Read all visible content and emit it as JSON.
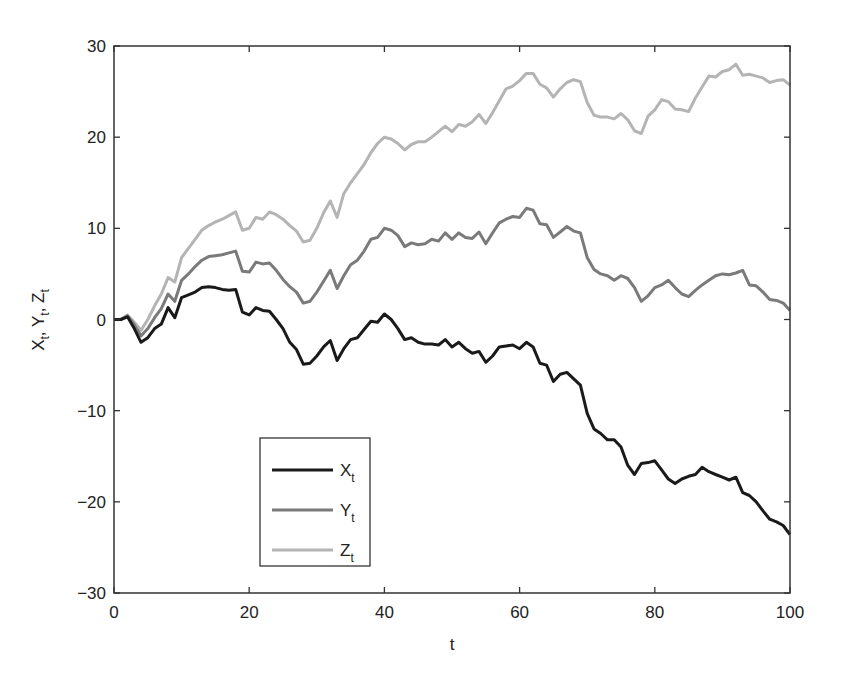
{
  "chart_data": {
    "type": "line",
    "title": "",
    "xlabel": "t",
    "ylabel": "X_t, Y_t, Z_t",
    "xlim": [
      0,
      100
    ],
    "ylim": [
      -30,
      30
    ],
    "xticks": [
      0,
      20,
      40,
      60,
      80,
      100
    ],
    "yticks": [
      -30,
      -20,
      -10,
      0,
      10,
      20,
      30
    ],
    "xtick_labels": [
      "0",
      "20",
      "40",
      "60",
      "80",
      "100"
    ],
    "ytick_labels": [
      "−30",
      "−20",
      "−10",
      "0",
      "10",
      "20",
      "30"
    ],
    "grid": false,
    "legend_position": "lower left (inside)",
    "x": [
      0,
      1,
      2,
      3,
      4,
      5,
      6,
      7,
      8,
      9,
      10,
      11,
      12,
      13,
      14,
      15,
      16,
      17,
      18,
      19,
      20,
      21,
      22,
      23,
      24,
      25,
      26,
      27,
      28,
      29,
      30,
      31,
      32,
      33,
      34,
      35,
      36,
      37,
      38,
      39,
      40,
      41,
      42,
      43,
      44,
      45,
      46,
      47,
      48,
      49,
      50,
      51,
      52,
      53,
      54,
      55,
      56,
      57,
      58,
      59,
      60,
      61,
      62,
      63,
      64,
      65,
      66,
      67,
      68,
      69,
      70,
      71,
      72,
      73,
      74,
      75,
      76,
      77,
      78,
      79,
      80,
      81,
      82,
      83,
      84,
      85,
      86,
      87,
      88,
      89,
      90,
      91,
      92,
      93,
      94,
      95,
      96,
      97,
      98,
      99,
      100
    ],
    "series": [
      {
        "name": "X_t",
        "label_main": "X",
        "label_sub": "t",
        "color": "#1a1a1a",
        "width": 3,
        "values": [
          0,
          0,
          0.3,
          -1,
          -2.5,
          -2,
          -1,
          -0.5,
          1.3,
          0.2,
          2.4,
          2.7,
          3,
          3.5,
          3.6,
          3.5,
          3.3,
          3.2,
          3.3,
          0.8,
          0.5,
          1.3,
          1,
          0.9,
          0,
          -1,
          -2.5,
          -3.3,
          -4.9,
          -4.8,
          -4,
          -3,
          -2.3,
          -4.5,
          -3.2,
          -2.2,
          -2,
          -1.1,
          -0.2,
          -0.3,
          0.6,
          0,
          -1,
          -2.2,
          -2,
          -2.5,
          -2.7,
          -2.7,
          -2.8,
          -2.2,
          -3,
          -2.5,
          -3.2,
          -3.7,
          -3.5,
          -4.7,
          -4,
          -3,
          -2.9,
          -2.8,
          -3.2,
          -2.5,
          -3,
          -4.8,
          -5,
          -6.8,
          -6,
          -5.8,
          -6.5,
          -7.2,
          -10.3,
          -12,
          -12.5,
          -13.2,
          -13.2,
          -14,
          -16,
          -17,
          -15.8,
          -15.7,
          -15.5,
          -16.5,
          -17.5,
          -18,
          -17.5,
          -17.2,
          -17,
          -16.2,
          -16.7,
          -17,
          -17.3,
          -17.6,
          -17.3,
          -19,
          -19.3,
          -20,
          -21,
          -21.9,
          -22.2,
          -22.6,
          -23.6
        ]
      },
      {
        "name": "Y_t",
        "label_main": "Y",
        "label_sub": "t",
        "color": "#7a7a7a",
        "width": 3,
        "values": [
          0,
          0,
          0.4,
          -0.6,
          -1.8,
          -1,
          0.2,
          1.2,
          2.8,
          2,
          4.3,
          5,
          5.8,
          6.5,
          6.9,
          7,
          7.1,
          7.3,
          7.5,
          5.3,
          5.2,
          6.3,
          6.1,
          6.2,
          5.4,
          4.4,
          3.6,
          3,
          1.8,
          2,
          3,
          4.2,
          5.4,
          3.4,
          4.8,
          6,
          6.5,
          7.5,
          8.8,
          9,
          10,
          9.8,
          9.2,
          8,
          8.4,
          8.2,
          8.3,
          8.8,
          8.6,
          9.5,
          8.8,
          9.5,
          9,
          8.9,
          9.6,
          8.3,
          9.5,
          10.6,
          11,
          11.3,
          11.2,
          12.2,
          12,
          10.5,
          10.4,
          9,
          9.6,
          10.2,
          9.7,
          9.5,
          6.8,
          5.5,
          5,
          4.8,
          4.3,
          4.8,
          4.5,
          3.5,
          2,
          2.6,
          3.5,
          3.8,
          4.3,
          3.5,
          2.8,
          2.5,
          3.2,
          3.8,
          4.3,
          4.8,
          5,
          4.9,
          5.1,
          5.4,
          3.8,
          3.7,
          3,
          2.2,
          2.1,
          1.8,
          1
        ]
      },
      {
        "name": "Z_t",
        "label_main": "Z",
        "label_sub": "t",
        "color": "#b4b4b4",
        "width": 3,
        "values": [
          0,
          0,
          0.5,
          -0.3,
          -1.2,
          0,
          1.5,
          2.8,
          4.6,
          4.1,
          6.8,
          7.8,
          8.8,
          9.8,
          10.3,
          10.7,
          11,
          11.4,
          11.8,
          9.8,
          10,
          11.2,
          11,
          11.8,
          11.5,
          11,
          10.3,
          9.7,
          8.5,
          8.7,
          10,
          11.7,
          13,
          11.2,
          13.8,
          15,
          16,
          17,
          18.3,
          19.3,
          20,
          19.8,
          19.3,
          18.6,
          19.2,
          19.5,
          19.5,
          20,
          20.6,
          21.2,
          20.6,
          21.4,
          21.2,
          21.7,
          22.5,
          21.5,
          22.7,
          24,
          25.3,
          25.6,
          26.2,
          27,
          27,
          25.8,
          25.4,
          24.4,
          25.3,
          26,
          26.3,
          26.1,
          23.8,
          22.4,
          22.2,
          22.2,
          22,
          22.6,
          21.9,
          20.7,
          20.4,
          22.3,
          23,
          24.1,
          23.9,
          23.1,
          23,
          22.8,
          24.3,
          25.5,
          26.7,
          26.6,
          27.2,
          27.4,
          28,
          26.8,
          26.9,
          26.7,
          26.5,
          26,
          26.2,
          26.3,
          25.7
        ]
      }
    ]
  }
}
